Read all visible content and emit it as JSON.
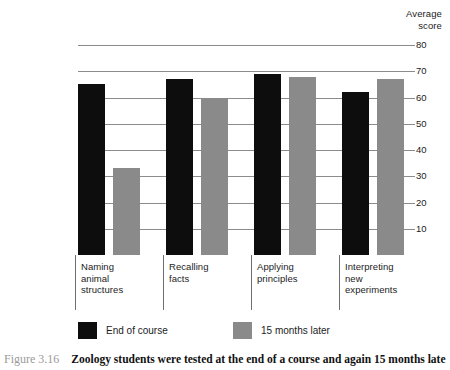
{
  "figure": {
    "number_label": "Figure 3.16",
    "caption": "Zoology students were tested at the end of a course and again 15 months late"
  },
  "axis": {
    "title_line1": "Average",
    "title_line2": "score",
    "ticks": [
      "80",
      "70",
      "60",
      "50",
      "40",
      "30",
      "20",
      "10"
    ]
  },
  "legend": {
    "items": [
      {
        "label": "End of course",
        "color": "#0d0d0d"
      },
      {
        "label": "15 months later",
        "color": "#8a8a8a"
      }
    ]
  },
  "categories": [
    {
      "label": "Naming\nanimal\nstructures"
    },
    {
      "label": "Recalling\nfacts"
    },
    {
      "label": "Applying\nprinciples"
    },
    {
      "label": "Interpreting\nnew\nexperiments"
    }
  ],
  "chart_data": {
    "type": "bar",
    "xlabel": "",
    "ylabel": "Average score",
    "ylim": [
      0,
      80
    ],
    "yticks": [
      10,
      20,
      30,
      40,
      50,
      60,
      70,
      80
    ],
    "grid": true,
    "legend_position": "bottom",
    "categories": [
      "Naming animal structures",
      "Recalling facts",
      "Applying principles",
      "Interpreting new experiments"
    ],
    "series": [
      {
        "name": "End of course",
        "color": "#0d0d0d",
        "values": [
          65,
          67,
          69,
          62
        ]
      },
      {
        "name": "15 months later",
        "color": "#8a8a8a",
        "values": [
          33,
          60,
          68,
          67
        ]
      }
    ]
  }
}
